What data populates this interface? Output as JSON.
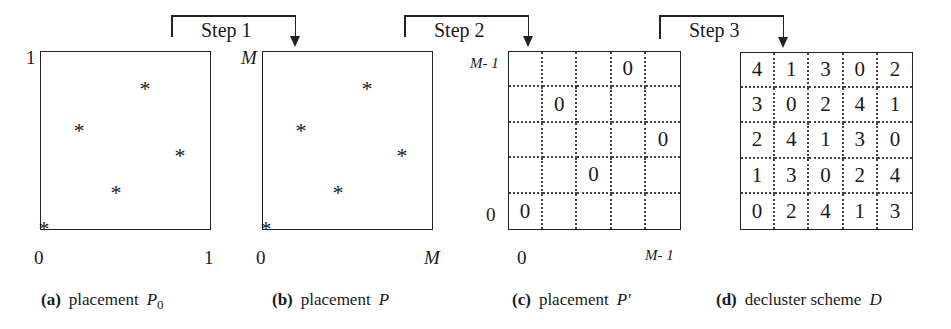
{
  "steps": [
    {
      "label": "Step 1"
    },
    {
      "label": "Step 2"
    },
    {
      "label": "Step 3"
    }
  ],
  "panel_a": {
    "caption_label": "(a)",
    "caption_text": "placement",
    "caption_symbol": "P",
    "caption_subscript": "0",
    "y_top_label": "1",
    "x_left_label": "0",
    "x_right_label": "1",
    "points": [
      {
        "x": 0.61,
        "y": 0.81
      },
      {
        "x": 0.22,
        "y": 0.57
      },
      {
        "x": 0.82,
        "y": 0.43
      },
      {
        "x": 0.44,
        "y": 0.22
      },
      {
        "x": 0.02,
        "y": 0.01
      }
    ],
    "marker": "*"
  },
  "panel_b": {
    "caption_label": "(b)",
    "caption_text": "placement",
    "caption_symbol": "P",
    "y_top_label": "M",
    "x_left_label": "0",
    "x_right_label": "M",
    "marker": "*"
  },
  "panel_c": {
    "caption_label": "(c)",
    "caption_text": "placement",
    "caption_symbol": "P'",
    "y_top_label": "M- 1",
    "y_bottom_label": "0",
    "x_left_label": "0",
    "x_right_label": "M- 1",
    "grid": [
      [
        "",
        "",
        "",
        "0",
        ""
      ],
      [
        "",
        "0",
        "",
        "",
        ""
      ],
      [
        "",
        "",
        "",
        "",
        "0"
      ],
      [
        "",
        "",
        "0",
        "",
        ""
      ],
      [
        "0",
        "",
        "",
        "",
        ""
      ]
    ]
  },
  "panel_d": {
    "caption_label": "(d)",
    "caption_text": "decluster scheme",
    "caption_symbol": "D",
    "grid": [
      [
        "4",
        "1",
        "3",
        "0",
        "2"
      ],
      [
        "3",
        "0",
        "2",
        "4",
        "1"
      ],
      [
        "2",
        "4",
        "1",
        "3",
        "0"
      ],
      [
        "1",
        "3",
        "0",
        "2",
        "4"
      ],
      [
        "0",
        "2",
        "4",
        "1",
        "3"
      ]
    ]
  }
}
